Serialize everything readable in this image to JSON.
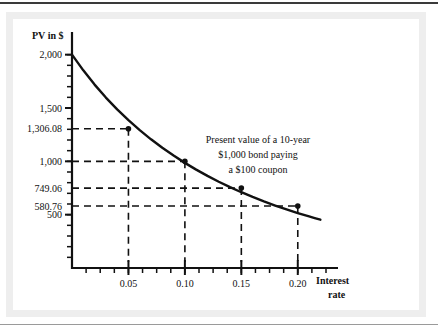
{
  "figure": {
    "background_color": "#ffffff",
    "frame_color": "#eeeeee",
    "rule_color": "#3a3a3a"
  },
  "chart_data": {
    "type": "line",
    "title": "",
    "subtitle": "",
    "xlabel": "Interest rate",
    "xlabel_line1": "Interest",
    "xlabel_line2": "rate",
    "ylabel": "PV in $",
    "xlim": [
      0,
      0.225
    ],
    "ylim": [
      0,
      2100
    ],
    "grid": false,
    "legend": "none",
    "curve_color": "#111111",
    "dash_color": "#111111",
    "marker_color": "#111111",
    "x_ticks": [
      0.05,
      0.1,
      0.15,
      0.2
    ],
    "x_tick_labels": [
      "0.05",
      "0.10",
      "0.15",
      "0.20"
    ],
    "y_ticks": [
      2000,
      1500,
      1000,
      500
    ],
    "y_tick_labels": [
      "2,000",
      "1,500",
      "1,000",
      "500"
    ],
    "y_value_labels": [
      "1,306.08",
      "749.06",
      "580.76"
    ],
    "annotation_lines": [
      "Present value of a 10-year",
      "$1,000 bond paying",
      "a $100 coupon"
    ],
    "annotation": "Present value of a 10-year $1,000 bond paying a $100 coupon",
    "marked_points": [
      {
        "x": 0.05,
        "y": 1306.08,
        "label": "1,306.08"
      },
      {
        "x": 0.1,
        "y": 1000.0,
        "label": "1,000"
      },
      {
        "x": 0.15,
        "y": 749.06,
        "label": "749.06"
      },
      {
        "x": 0.2,
        "y": 580.76,
        "label": "580.76"
      }
    ],
    "x": [
      0.0,
      0.01,
      0.02,
      0.03,
      0.04,
      0.05,
      0.06,
      0.07,
      0.08,
      0.09,
      0.1,
      0.11,
      0.12,
      0.13,
      0.14,
      0.15,
      0.16,
      0.17,
      0.18,
      0.19,
      0.2,
      0.21,
      0.215,
      0.22
    ],
    "values": [
      2000.0,
      1852.8,
      1719.29,
      1597.81,
      1486.93,
      1385.4,
      1292.14,
      1206.26,
      1126.97,
      1053.61,
      985.6,
      922.44,
      863.7,
      808.99,
      757.99,
      710.4,
      665.95,
      624.4,
      585.54,
      549.17,
      515.11,
      483.17,
      468.0,
      453.12
    ],
    "series": [
      {
        "name": "Present value of a 10-year $1,000 bond paying a $100 coupon",
        "values": [
          2000.0,
          1852.8,
          1719.29,
          1597.81,
          1486.93,
          1385.4,
          1292.14,
          1206.26,
          1126.97,
          1053.61,
          985.6,
          922.44,
          863.7,
          808.99,
          757.99,
          710.4,
          665.95,
          624.4,
          585.54,
          549.17,
          515.11,
          483.17,
          468.0,
          453.12
        ]
      }
    ],
    "minor_tick_count_x": 4,
    "minor_tick_count_y": 4
  }
}
